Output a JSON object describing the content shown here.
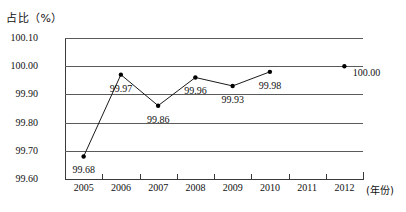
{
  "chart_data": {
    "type": "line",
    "title": "占比（%）",
    "xlabel": "(年份)",
    "ylabel": "占比（%）",
    "categories": [
      "2005",
      "2006",
      "2007",
      "2008",
      "2009",
      "2010",
      "2011",
      "2012"
    ],
    "values": [
      99.68,
      99.97,
      99.86,
      99.96,
      99.93,
      99.98,
      null,
      100.0
    ],
    "point_labels": [
      "99.68",
      "99.97",
      "99.86",
      "99.96",
      "99.93",
      "99.98",
      "",
      "100.00"
    ],
    "ylim": [
      99.6,
      100.1
    ],
    "yticks": [
      "99.60",
      "99.70",
      "99.80",
      "99.90",
      "100.00",
      "100.10"
    ],
    "ytick_values": [
      99.6,
      99.7,
      99.8,
      99.9,
      100.0,
      100.1
    ],
    "grid": true,
    "legend": "none",
    "line_color": "#1a1a1a",
    "marker_color": "#000000",
    "grid_color": "#5a5a5a",
    "background": "#ffffff",
    "connected_segments": [
      [
        0,
        1,
        2,
        3,
        4,
        5
      ]
    ],
    "isolated_points": [
      7
    ]
  },
  "axis_title": {
    "text": "占比（%）"
  },
  "xaxis_unit": {
    "text": "(年份)"
  }
}
